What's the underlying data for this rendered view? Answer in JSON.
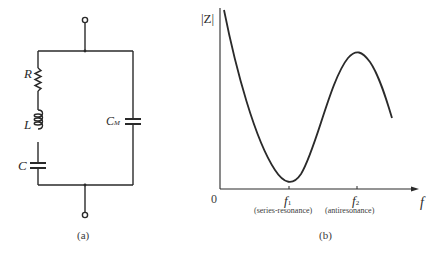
{
  "panel_a": {
    "caption": "(a)",
    "components": {
      "resistor": "R",
      "inductor": "L",
      "capacitor": "C",
      "motional_capacitor": "C",
      "motional_capacitor_sub": "M"
    }
  },
  "panel_b": {
    "caption": "(b)",
    "y_label": "|Z|",
    "x_label": "f",
    "origin": "0",
    "f1": "f",
    "f1_sub": "1",
    "f2": "f",
    "f2_sub": "2",
    "f1_note": "(series-resonance)",
    "f2_note": "(antiresonance)"
  },
  "colors": {
    "ink": "#2a2a2a",
    "background": "#ffffff"
  }
}
